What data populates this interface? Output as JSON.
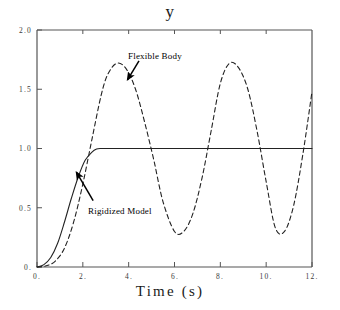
{
  "figure": {
    "title": "y",
    "background": "#ffffff",
    "frame_color": "#555555"
  },
  "chart_data": {
    "type": "line",
    "title": "y",
    "xlabel": "Time (s)",
    "ylabel": "y",
    "xlim": [
      0,
      12
    ],
    "ylim": [
      0,
      2.0
    ],
    "grid": false,
    "legend": "none",
    "xticks": [
      0,
      2,
      4,
      6,
      8,
      10,
      12
    ],
    "xtick_labels": [
      "0.",
      "2.",
      "4.",
      "6.",
      "8.",
      "10.",
      "12."
    ],
    "yticks": [
      0,
      0.5,
      1.0,
      1.5,
      2.0
    ],
    "ytick_labels": [
      "0.",
      "0.5",
      "1.0",
      "1.5",
      "2.0"
    ],
    "series": [
      {
        "name": "Rigidized Model",
        "style": "solid",
        "color": "#222222",
        "x": [
          0.0,
          0.3,
          0.6,
          0.9,
          1.2,
          1.5,
          1.8,
          2.1,
          2.4,
          2.6,
          2.8,
          3.2,
          4.0,
          5.0,
          6.0,
          7.0,
          8.0,
          9.0,
          10.0,
          11.0,
          12.0
        ],
        "y": [
          0.0,
          0.02,
          0.08,
          0.2,
          0.38,
          0.58,
          0.76,
          0.9,
          0.97,
          0.995,
          1.0,
          1.0,
          1.0,
          1.0,
          1.0,
          1.0,
          1.0,
          1.0,
          1.0,
          1.0,
          1.0
        ]
      },
      {
        "name": "Flexible Body",
        "style": "dashed",
        "color": "#222222",
        "x": [
          0.0,
          0.4,
          0.8,
          1.2,
          1.6,
          2.0,
          2.4,
          2.8,
          3.1,
          3.5,
          3.9,
          4.3,
          4.7,
          5.1,
          5.5,
          6.0,
          6.4,
          6.8,
          7.2,
          7.6,
          8.0,
          8.4,
          8.8,
          9.2,
          9.6,
          10.0,
          10.4,
          10.8,
          11.2,
          11.6,
          12.0
        ],
        "y": [
          0.0,
          0.01,
          0.05,
          0.16,
          0.38,
          0.7,
          1.08,
          1.45,
          1.63,
          1.72,
          1.67,
          1.5,
          1.22,
          0.9,
          0.55,
          0.3,
          0.3,
          0.45,
          0.75,
          1.15,
          1.55,
          1.72,
          1.68,
          1.5,
          1.15,
          0.72,
          0.33,
          0.3,
          0.52,
          0.95,
          1.48
        ]
      }
    ],
    "annotations": [
      {
        "text": "Flexible Body",
        "label_x": 4.2,
        "label_y": 1.82,
        "arrow_from": [
          4.45,
          1.74
        ],
        "arrow_to": [
          3.95,
          1.58
        ]
      },
      {
        "text": "Rigidized Model",
        "label_x": 2.5,
        "label_y": 0.52,
        "arrow_from": [
          2.45,
          0.56
        ],
        "arrow_to": [
          1.72,
          0.8
        ]
      }
    ]
  },
  "axes": {
    "x_tick_labels": [
      "0.",
      "2.",
      "4.",
      "6.",
      "8.",
      "10.",
      "12."
    ],
    "y_tick_labels": [
      "2.0",
      "1.5",
      "1.0",
      "0.5",
      "0."
    ]
  },
  "annotations": {
    "flexible_body": "Flexible Body",
    "rigidized_model": "Rigidized Model"
  },
  "labels": {
    "x_axis_title": "Time (s)"
  }
}
